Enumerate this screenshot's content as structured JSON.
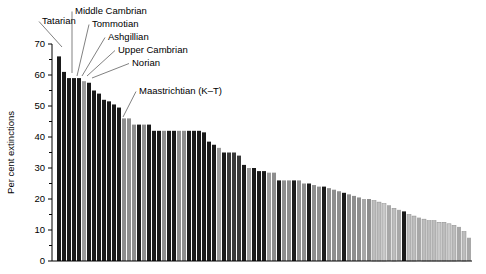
{
  "chart_data": {
    "type": "bar",
    "title": "",
    "xlabel": "",
    "ylabel": "Per cent extinctions",
    "ylim": [
      0,
      70
    ],
    "yticks": [
      0,
      10,
      20,
      30,
      40,
      50,
      60,
      70
    ],
    "ytick_labels": [
      "0",
      "10",
      "20",
      "30",
      "40",
      "50",
      "60",
      "70"
    ],
    "grid": false,
    "legend": "none",
    "xaxis_ticks_visible": false,
    "bar_count": 83,
    "values": [
      66,
      61,
      59,
      59,
      59,
      58,
      57.5,
      55,
      54,
      52,
      51.5,
      50.5,
      49.5,
      46,
      46,
      44,
      44,
      44,
      44,
      42,
      42,
      42,
      42,
      42,
      42,
      42,
      42,
      42,
      42,
      41.5,
      38.5,
      37.5,
      36.5,
      35,
      35,
      35,
      34,
      31,
      30,
      30,
      29,
      29,
      28.5,
      28.5,
      26,
      26,
      26,
      26,
      26,
      25,
      25,
      24.5,
      24,
      24,
      23.5,
      23,
      22.5,
      22,
      21.5,
      21,
      20.5,
      20,
      20,
      19.5,
      19,
      18.5,
      18,
      17,
      16.5,
      16,
      15,
      14.5,
      14,
      13.5,
      13,
      13,
      12.5,
      12.5,
      12,
      11.5,
      11,
      9.5,
      7.5
    ],
    "bar_shades": [
      "#1a1a1a",
      "#1a1a1a",
      "#1a1a1a",
      "#1a1a1a",
      "#1a1a1a",
      "#9b9b9b",
      "#1a1a1a",
      "#1a1a1a",
      "#1a1a1a",
      "#1a1a1a",
      "#1a1a1a",
      "#1a1a1a",
      "#1a1a1a",
      "#8e8e8e",
      "#8e8e8e",
      "#8e8e8e",
      "#1a1a1a",
      "#8e8e8e",
      "#1a1a1a",
      "#1a1a1a",
      "#1a1a1a",
      "#8e8e8e",
      "#1a1a1a",
      "#1a1a1a",
      "#8e8e8e",
      "#8e8e8e",
      "#1a1a1a",
      "#1a1a1a",
      "#1a1a1a",
      "#1a1a1a",
      "#1a1a1a",
      "#1a1a1a",
      "#9b9b9b",
      "#1a1a1a",
      "#3a3a3a",
      "#3a3a3a",
      "#3a3a3a",
      "#1a1a1a",
      "#9b9b9b",
      "#1a1a1a",
      "#1a1a1a",
      "#1a1a1a",
      "#9b9b9b",
      "#8e8e8e",
      "#1a1a1a",
      "#8e8e8e",
      "#8e8e8e",
      "#1a1a1a",
      "#8e8e8e",
      "#8e8e8e",
      "#1a1a1a",
      "#8e8e8e",
      "#8e8e8e",
      "#1a1a1a",
      "#8e8e8e",
      "#8e8e8e",
      "#8e8e8e",
      "#1a1a1a",
      "#8e8e8e",
      "#8e8e8e",
      "#8e8e8e",
      "#a8a8a8",
      "#8e8e8e",
      "#bdbdbd",
      "#bdbdbd",
      "#c9c9c9",
      "#a8a8a8",
      "#bdbdbd",
      "#a8a8a8",
      "#1a1a1a",
      "#bdbdbd",
      "#bdbdbd",
      "#a8a8a8",
      "#bdbdbd",
      "#bdbdbd",
      "#bdbdbd",
      "#c9c9c9",
      "#bdbdbd",
      "#c9c9c9",
      "#bdbdbd",
      "#a8a8a8",
      "#bdbdbd",
      "#a8a8a8"
    ]
  },
  "annotations": [
    {
      "label": "Tatarian",
      "text_x": 42,
      "text_y": 20,
      "tip_x": 62,
      "tip_y": 47
    },
    {
      "label": "Middle Cambrian",
      "text_x": 75,
      "text_y": 10,
      "tip_x": 72,
      "tip_y": 73
    },
    {
      "label": "Tommotian",
      "text_x": 92,
      "text_y": 23,
      "tip_x": 77,
      "tip_y": 76
    },
    {
      "label": "Ashgillian",
      "text_x": 108,
      "text_y": 36,
      "tip_x": 82,
      "tip_y": 76
    },
    {
      "label": "Upper Cambrian",
      "text_x": 118,
      "text_y": 49,
      "tip_x": 87,
      "tip_y": 76
    },
    {
      "label": "Norian",
      "text_x": 132,
      "text_y": 62,
      "tip_x": 92,
      "tip_y": 78
    },
    {
      "label": "Maastrichtian (K–T)",
      "text_x": 139,
      "text_y": 90,
      "tip_x": 123,
      "tip_y": 117
    }
  ],
  "axis": {
    "y_label": "Per cent extinctions",
    "plot_left": 57,
    "plot_right": 472,
    "baseline_y": 261,
    "top_y": 44,
    "bar_pitch": 5,
    "bar_width": 4
  }
}
